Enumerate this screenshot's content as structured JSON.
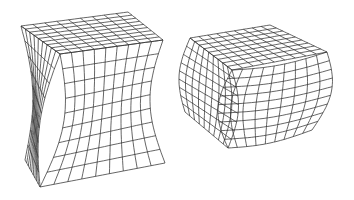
{
  "figure": {
    "width": 354,
    "height": 200,
    "background": "#ffffff",
    "line_color": "#333333",
    "shapes": [
      {
        "name": "pincushion-cube",
        "deformation": "concave",
        "grid": 9,
        "corners": {
          "top_back_left": [
            21,
            26
          ],
          "top_back_right": [
            128,
            12
          ],
          "top_front_right": [
            163,
            40
          ],
          "top_front_left": [
            60,
            54
          ],
          "bottom_front_left": [
            40,
            187
          ],
          "bottom_front_right": [
            165,
            163
          ],
          "bottom_back_left": [
            25,
            160
          ]
        },
        "bulge": -14
      },
      {
        "name": "barrel-cube",
        "deformation": "convex",
        "grid": 9,
        "corners": {
          "top_back_left": [
            190,
            38
          ],
          "top_back_right": [
            270,
            25
          ],
          "top_front_right": [
            327,
            52
          ],
          "top_front_left": [
            232,
            70
          ],
          "bottom_front_left": [
            228,
            148
          ],
          "bottom_front_right": [
            312,
            130
          ],
          "bottom_back_left": [
            185,
            112
          ]
        },
        "bulge": 12
      }
    ]
  }
}
